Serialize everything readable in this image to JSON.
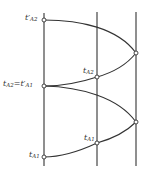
{
  "diagram": {
    "type": "timing-diagram",
    "stroke_color": "#333333",
    "node_fill": "#ffffff",
    "labels": {
      "top_left": {
        "base": "t′",
        "sub": "A2"
      },
      "mid_left": {
        "base": "t",
        "sub": "A2",
        "eq": "=t′",
        "sub2": "A1"
      },
      "bottom_left": {
        "base": "t",
        "sub": "A1"
      },
      "mid_upper": {
        "base": "t",
        "sub": "A2"
      },
      "mid_lower": {
        "base": "t",
        "sub": "A1"
      }
    },
    "verticals": [
      {
        "name": "left",
        "x": 44
      },
      {
        "name": "middle",
        "x": 97
      },
      {
        "name": "right",
        "x": 136
      }
    ],
    "nodes": [
      {
        "name": "t-prime-a2",
        "x": 44,
        "y": 20
      },
      {
        "name": "upper-right-vertex",
        "x": 136,
        "y": 53
      },
      {
        "name": "t-a2-mid",
        "x": 97,
        "y": 77
      },
      {
        "name": "t-a2-equals-t-prime-a1",
        "x": 44,
        "y": 86
      },
      {
        "name": "lower-right-vertex",
        "x": 136,
        "y": 122
      },
      {
        "name": "t-a1-mid",
        "x": 97,
        "y": 143
      },
      {
        "name": "t-a1",
        "x": 44,
        "y": 157
      }
    ]
  }
}
